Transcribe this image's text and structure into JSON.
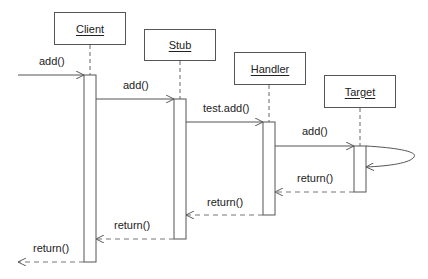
{
  "diagram": {
    "type": "sequence",
    "colors": {
      "line": "#555555",
      "dashed": "#777777",
      "text": "#222222",
      "background": "#ffffff"
    },
    "objects": [
      {
        "id": "client",
        "label": "Client"
      },
      {
        "id": "stub",
        "label": "Stub"
      },
      {
        "id": "handler",
        "label": "Handler"
      },
      {
        "id": "target",
        "label": "Target"
      }
    ],
    "messages": [
      {
        "from": "external",
        "to": "client",
        "label": "add()",
        "kind": "call"
      },
      {
        "from": "client",
        "to": "stub",
        "label": "add()",
        "kind": "call"
      },
      {
        "from": "stub",
        "to": "handler",
        "label": "test.add()",
        "kind": "call"
      },
      {
        "from": "handler",
        "to": "target",
        "label": "add()",
        "kind": "call"
      },
      {
        "from": "target",
        "to": "target",
        "label": "",
        "kind": "self-call"
      },
      {
        "from": "target",
        "to": "handler",
        "label": "return()",
        "kind": "return"
      },
      {
        "from": "handler",
        "to": "stub",
        "label": "return()",
        "kind": "return"
      },
      {
        "from": "stub",
        "to": "client",
        "label": "return()",
        "kind": "return"
      },
      {
        "from": "client",
        "to": "external",
        "label": "return()",
        "kind": "return"
      }
    ]
  }
}
